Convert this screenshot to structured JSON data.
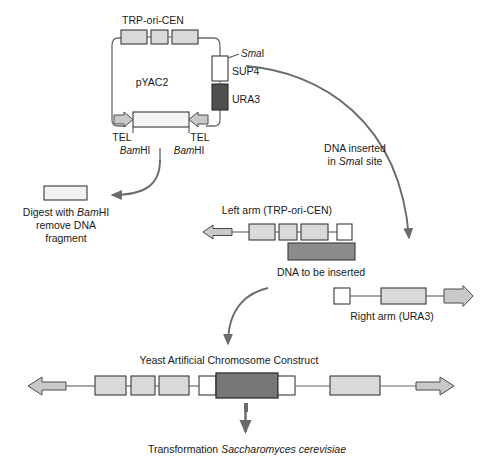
{
  "figure": {
    "type": "molecular-biology-schematic",
    "title_implicit": "Construction of a Yeast Artificial Chromosome (YAC)",
    "background_color": "#ffffff",
    "line_color": "#555555",
    "text_color": "#1a1a1a"
  },
  "colors": {
    "light_gray_box": "#d9d9d9",
    "mid_gray_box": "#8c8c8c",
    "dark_gray_box": "#4f4f4f",
    "white_box": "#ffffff",
    "box_stroke": "#3a3a3a",
    "arrow_fill": "#c9c9c9",
    "arrow_stroke": "#4a4a4a",
    "curve_stroke": "#6b6b6b"
  },
  "plasmid": {
    "name": "pYAC2",
    "top_label": "TRP-ori-CEN",
    "segments_top": [
      "TRP1",
      "ARS1",
      "CEN4"
    ],
    "right_labels": {
      "enzyme_site_italic": "Sma",
      "enzyme_site_rest": "I",
      "marker_sup": "SUP4",
      "marker_ura": "URA3"
    },
    "telomere_left_label": "TEL",
    "telomere_right_label": "TEL",
    "restriction_left_italic": "Bam",
    "restriction_left_rest": "HI",
    "restriction_right_italic": "Bam",
    "restriction_right_rest": "HI"
  },
  "digest_step": {
    "line1_pre": "Digest with ",
    "line1_italic": "Bam",
    "line1_post": "HI",
    "line2": "remove DNA",
    "line3": "fragment"
  },
  "insert_step": {
    "line1": "DNA inserted",
    "line2_pre": "in ",
    "line2_italic": "Sma",
    "line2_post": "I site"
  },
  "left_arm": {
    "label": "Left arm (TRP-ori-CEN)",
    "segments": [
      "TRP1",
      "ARS1",
      "CEN4",
      "site"
    ]
  },
  "insert_dna": {
    "label": "DNA to be inserted"
  },
  "right_arm": {
    "label": "Right arm (URA3)"
  },
  "construct": {
    "title": "Yeast Artificial Chromosome Construct"
  },
  "transformation": {
    "pre": "Transformation ",
    "italic": "Saccharomyces cerevisiae"
  }
}
